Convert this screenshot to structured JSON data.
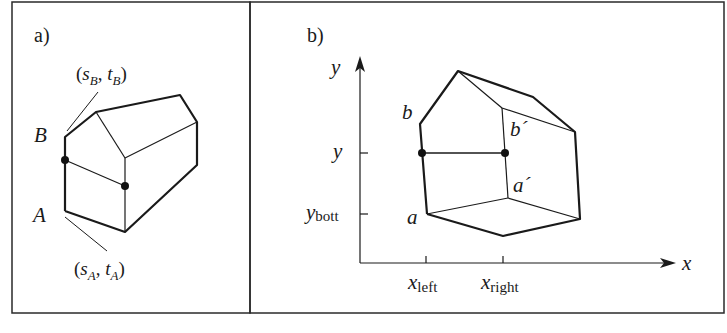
{
  "panel_a": {
    "label": "a)",
    "point_B": "B",
    "point_A": "A",
    "coord_B": {
      "open": "(",
      "s": "s",
      "s_sub": "B",
      "comma": ", ",
      "t": "t",
      "t_sub": "B",
      "close": ")"
    },
    "coord_A": {
      "open": "(",
      "s": "s",
      "s_sub": "A",
      "comma": ", ",
      "t": "t",
      "t_sub": "A",
      "close": ")"
    }
  },
  "panel_b": {
    "label": "b)",
    "y_axis_label": "y",
    "x_axis_label": "x",
    "y_tick_label": "y",
    "y_bott_main": "y",
    "y_bott_sub": "bott",
    "x_left_main": "x",
    "x_left_sub": "left",
    "x_right_main": "x",
    "x_right_sub": "right",
    "vertex_b": "b",
    "vertex_a": "a",
    "vertex_b_prime": "b´",
    "vertex_a_prime": "a´"
  },
  "colors": {
    "line": "#1a1a1a",
    "frame": "#2a2a2a",
    "background": "#ffffff"
  }
}
